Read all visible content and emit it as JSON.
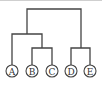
{
  "diagram": {
    "type": "dendrogram",
    "leaves": [
      {
        "id": "A",
        "label": "A",
        "x": 12
      },
      {
        "id": "B",
        "label": "B",
        "x": 32
      },
      {
        "id": "C",
        "label": "C",
        "x": 52
      },
      {
        "id": "D",
        "label": "D",
        "x": 71
      },
      {
        "id": "E",
        "label": "E",
        "x": 90
      }
    ],
    "merges": [
      {
        "children": [
          "B",
          "C"
        ],
        "height_y": 48
      },
      {
        "children": [
          "D",
          "E"
        ],
        "height_y": 48
      },
      {
        "children": [
          "A",
          "BC"
        ],
        "height_y": 34
      },
      {
        "children": [
          "ABC",
          "DE"
        ],
        "height_y": 9
      }
    ],
    "colors": {
      "line": "#444444",
      "node_fill": "#ffffff",
      "text": "#333333"
    }
  }
}
